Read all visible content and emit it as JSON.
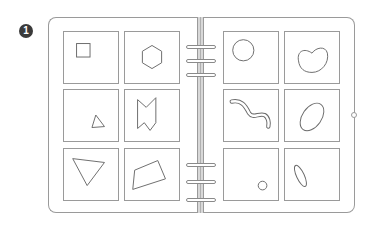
{
  "figure": {
    "badge_number": "1",
    "colors": {
      "stroke": "#9a9a9a",
      "shape_stroke": "#6a6a6a",
      "badge": "#3a3a3a"
    },
    "left_page": {
      "cells": [
        {
          "row": 1,
          "col": 1,
          "shape": "small-square"
        },
        {
          "row": 1,
          "col": 2,
          "shape": "hexagon"
        },
        {
          "row": 2,
          "col": 1,
          "shape": "small-triangle"
        },
        {
          "row": 2,
          "col": 2,
          "shape": "notched-bow-polygon"
        },
        {
          "row": 3,
          "col": 1,
          "shape": "inverted-triangle"
        },
        {
          "row": 3,
          "col": 2,
          "shape": "quadrilateral"
        }
      ]
    },
    "right_page": {
      "cells": [
        {
          "row": 1,
          "col": 1,
          "shape": "circle"
        },
        {
          "row": 1,
          "col": 2,
          "shape": "kidney-bean"
        },
        {
          "row": 2,
          "col": 1,
          "shape": "wavy-worm"
        },
        {
          "row": 2,
          "col": 2,
          "shape": "tilted-ellipse"
        },
        {
          "row": 3,
          "col": 1,
          "shape": "small-circle"
        },
        {
          "row": 3,
          "col": 2,
          "shape": "thin-ellipse"
        }
      ]
    },
    "binder_rings": {
      "top_group": 3,
      "bottom_group": 3
    }
  }
}
